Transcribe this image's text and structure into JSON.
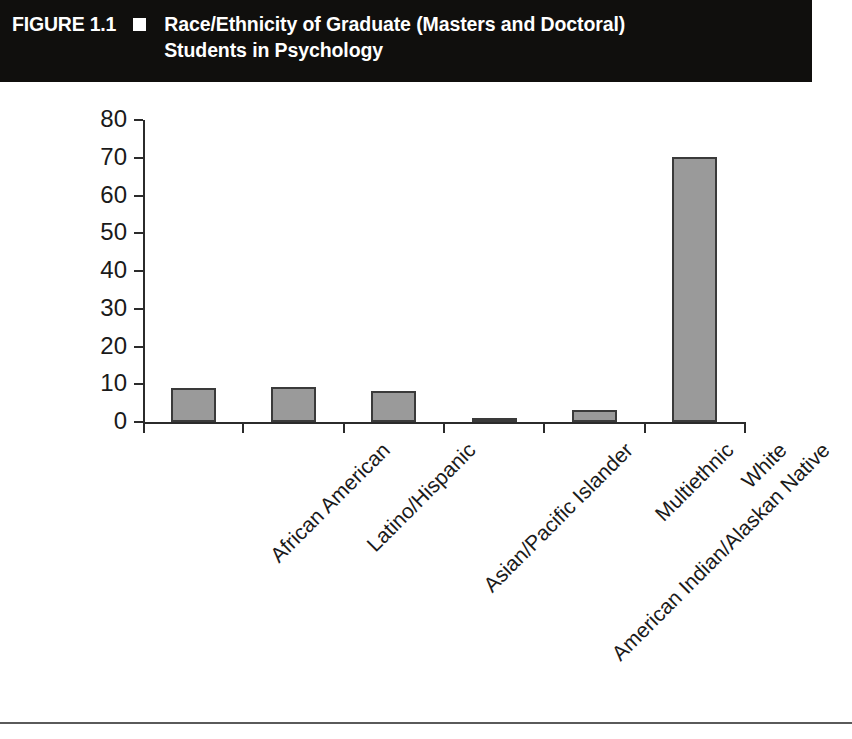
{
  "header": {
    "figure_number": "FIGURE 1.1",
    "bullet_icon": "black-square-bullet",
    "title_line1": "Race/Ethnicity of Graduate (Masters and Doctoral)",
    "title_line2": "Students in Psychology",
    "background_color": "#100f0d",
    "text_color": "#ffffff"
  },
  "chart_data": {
    "type": "bar",
    "title": "Race/Ethnicity of Graduate (Masters and Doctoral) Students in Psychology",
    "categories": [
      "African American",
      "Latino/Hispanic",
      "Asian/Pacific Islander",
      "American Indian/Alaskan Native",
      "Multiethnic",
      "White"
    ],
    "values": [
      9.0,
      9.3,
      8.1,
      0.8,
      3.3,
      70.2
    ],
    "xlabel": "",
    "ylabel": "",
    "ylim": [
      0,
      80
    ],
    "yticks": [
      0,
      10,
      20,
      30,
      40,
      50,
      60,
      70,
      80
    ],
    "ytick_labels": [
      "0",
      "10",
      "20",
      "30",
      "40",
      "50",
      "60",
      "70",
      "80"
    ],
    "grid": false,
    "legend": false,
    "bar_fill_color": "#9a9a9a",
    "bar_edge_color": "#3a3a3a",
    "axis_color": "#2b2b2b",
    "background_color": "#ffffff"
  }
}
